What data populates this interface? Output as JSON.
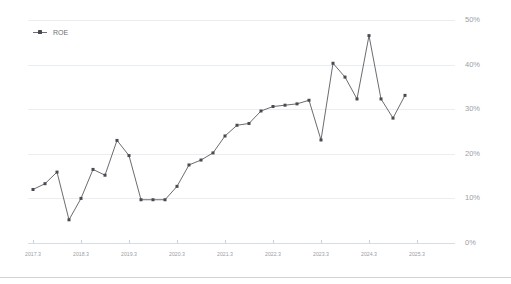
{
  "chart_data": {
    "type": "line",
    "title": "",
    "xlabel": "",
    "ylabel": "",
    "ylim": [
      0,
      50
    ],
    "ytick_labels": [
      "0%",
      "10%",
      "20%",
      "30%",
      "40%",
      "50%"
    ],
    "ytick_values": [
      0,
      10,
      20,
      30,
      40,
      50
    ],
    "yaxis_position": "right",
    "grid": true,
    "legend": {
      "position": "top-left",
      "entries": [
        "ROE"
      ]
    },
    "xtick_labels": [
      "2017.3",
      "2018.3",
      "2019.3",
      "2020.3",
      "2021.3",
      "2022.3",
      "2023.3",
      "2024.3",
      "2025.3"
    ],
    "series": [
      {
        "name": "ROE",
        "color": "#5a5a62",
        "marker": "square",
        "x": [
          "2017.3",
          "2017.6",
          "2017.9",
          "2017.12",
          "2018.3",
          "2018.6",
          "2018.9",
          "2018.12",
          "2019.3",
          "2019.6",
          "2019.9",
          "2019.12",
          "2020.3",
          "2020.6",
          "2020.9",
          "2020.12",
          "2021.3",
          "2021.6",
          "2021.9",
          "2021.12",
          "2022.3",
          "2022.6",
          "2022.9",
          "2022.12",
          "2023.3",
          "2023.6",
          "2023.9",
          "2023.12",
          "2024.3",
          "2024.6",
          "2024.9",
          "2024.12"
        ],
        "values": [
          12.0,
          13.3,
          15.9,
          5.2,
          10.0,
          16.5,
          15.2,
          23.0,
          19.6,
          9.7,
          9.7,
          9.7,
          12.7,
          17.5,
          18.6,
          20.2,
          24.0,
          26.4,
          26.8,
          29.6,
          30.6,
          30.9,
          31.2,
          32.0,
          23.1,
          40.3,
          37.2,
          32.3,
          46.5,
          32.3,
          28.0,
          33.1
        ]
      }
    ]
  },
  "colors": {
    "series": "#5a5a62",
    "grid": "#e9eef2",
    "axis": "#d7dde2",
    "tick_label": "#9aa0a6",
    "legend_label": "#6b7075",
    "background": "#ffffff"
  }
}
